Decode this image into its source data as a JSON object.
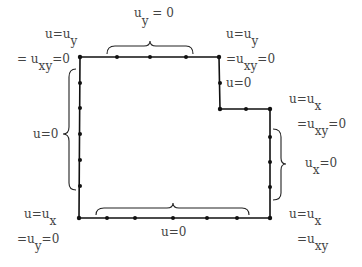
{
  "diagram": {
    "boundary_path": [
      [
        80,
        57
      ],
      [
        219,
        57
      ],
      [
        220,
        109
      ],
      [
        270,
        109
      ],
      [
        270,
        218
      ],
      [
        79,
        218
      ],
      [
        80,
        57
      ]
    ],
    "nodes": [
      [
        80,
        57
      ],
      [
        117,
        57
      ],
      [
        150,
        57
      ],
      [
        186,
        57
      ],
      [
        219,
        57
      ],
      [
        220,
        83
      ],
      [
        220,
        109
      ],
      [
        246,
        109
      ],
      [
        270,
        109
      ],
      [
        270,
        137
      ],
      [
        270,
        162
      ],
      [
        270,
        187
      ],
      [
        270,
        218
      ],
      [
        237,
        218
      ],
      [
        207,
        218
      ],
      [
        173,
        218
      ],
      [
        135,
        218
      ],
      [
        107,
        218
      ],
      [
        79,
        218
      ],
      [
        80,
        186
      ],
      [
        80,
        160
      ],
      [
        80,
        134
      ],
      [
        80,
        108
      ],
      [
        80,
        83
      ]
    ],
    "labels": {
      "top_brace": {
        "base": "u",
        "sub": "y",
        "rest": " = 0"
      },
      "top_left_corner": {
        "line1_base": "u=u",
        "line1_sub": "y",
        "line2_prefix": "= u",
        "line2_sub": "xy",
        "line2_rest": "=0"
      },
      "top_right_corner": {
        "line1_base": "u=u",
        "line1_sub": "y",
        "line2_prefix": "=u",
        "line2_sub": "xy",
        "line2_rest": "=0"
      },
      "inner_vertical": "u=0",
      "inner_corner": {
        "line1_base": "u=u",
        "line1_sub": "x",
        "line2_prefix": "=u",
        "line2_sub": "xy",
        "line2_rest": "=0"
      },
      "right_brace": {
        "base": "u",
        "sub": "x",
        "rest": "=0"
      },
      "left_brace": "u=0",
      "bottom_brace": "u=0",
      "bottom_left_corner": {
        "line1_base": "u=u",
        "line1_sub": "x",
        "line2_prefix": "=u",
        "line2_sub": "y",
        "line2_rest": "=0"
      },
      "bottom_right_corner": {
        "line1_base": "u=u",
        "line1_sub": "x",
        "line2_prefix": "=u",
        "line2_sub": "xy",
        "line2_rest": ""
      }
    }
  }
}
